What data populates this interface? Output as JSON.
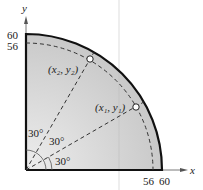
{
  "figure": {
    "axes": {
      "x_label": "x",
      "y_label": "y"
    },
    "y_ticks": [
      "60",
      "56"
    ],
    "x_ticks": [
      "56",
      "60"
    ],
    "points": [
      {
        "label": "(x₂, y₂)"
      },
      {
        "label": "(x₁, y₁)"
      }
    ],
    "angles": [
      "30°",
      "30°",
      "30°"
    ],
    "colors": {
      "fill": "#d6d6d6",
      "outline": "#111111",
      "dashed": "#333333"
    }
  }
}
